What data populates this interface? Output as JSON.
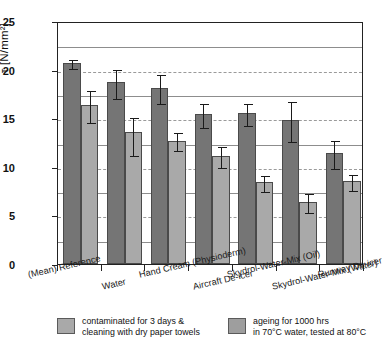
{
  "chart_data": {
    "type": "bar",
    "title": "",
    "xlabel": "",
    "ylabel": "τ [N/mm²]",
    "ylim": [
      0,
      25
    ],
    "yticks": [
      0,
      5,
      10,
      15,
      20,
      25
    ],
    "ytick_labels": [
      "0",
      "5",
      "10",
      "15",
      "20",
      "25"
    ],
    "grid": "horizontal gridlines every 2.5 units; solid at multiples of 5 and 2.5 major, dashed at intermediate",
    "gridlines_solid": [
      2.5,
      7.5,
      12.5,
      17.5,
      22.5
    ],
    "gridlines_dashed": [
      5,
      10,
      15,
      20
    ],
    "legend_position": "below-plot",
    "categories": [
      "(Mean) Reference",
      "Water",
      "Hand Cream (Physioderm)",
      "Aircraft De-icer",
      "Skydrol-Water-Mix (Oil)",
      "Skydrol-Water-Mix (Water)",
      "Runway De-icer"
    ],
    "series": [
      {
        "name": "contaminated for 3 days & cleaning with dry paper towels",
        "color": "#757575",
        "values": [
          20.7,
          18.7,
          18.1,
          15.4,
          15.5,
          14.8,
          11.4
        ],
        "err_low": [
          0.5,
          1.6,
          1.5,
          1.3,
          1.2,
          2.1,
          1.5
        ],
        "err_high": [
          0.5,
          1.5,
          1.5,
          1.3,
          1.2,
          2.1,
          1.5
        ]
      },
      {
        "name": "ageing for 1000 hrs in 70°C water, tested at 80°C",
        "color": "#a9a9a9",
        "values": [
          16.4,
          13.6,
          12.7,
          11.1,
          8.4,
          6.4,
          8.5
        ],
        "err_low": [
          1.8,
          2.4,
          1.0,
          1.1,
          0.9,
          1.0,
          0.9
        ],
        "err_high": [
          1.6,
          1.6,
          1.0,
          1.1,
          0.9,
          1.0,
          0.9
        ]
      }
    ]
  },
  "legend": {
    "items": [
      {
        "line1": "contaminated for 3 days &",
        "line2": "cleaning with dry paper towels"
      },
      {
        "line1": "ageing for 1000 hrs",
        "line2": "in 70°C water, tested at 80°C"
      }
    ]
  }
}
